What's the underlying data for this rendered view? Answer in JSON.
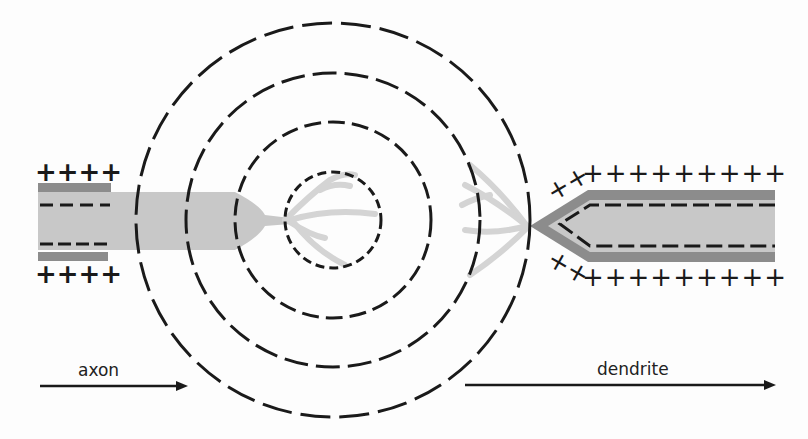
{
  "diagram": {
    "labels": {
      "axon": "axon",
      "dendrite": "dendrite"
    },
    "charges": {
      "positive": "+",
      "negative": "-"
    },
    "colors": {
      "ink": "#1a1a1a",
      "membrane": "#8c8c8c",
      "fiber": "#c8c8c8",
      "branches": "#d4d4d4",
      "background": "#fdfdfd"
    },
    "field_circles": {
      "center": [
        333,
        220
      ],
      "radii": [
        48,
        98,
        147,
        197
      ]
    }
  }
}
